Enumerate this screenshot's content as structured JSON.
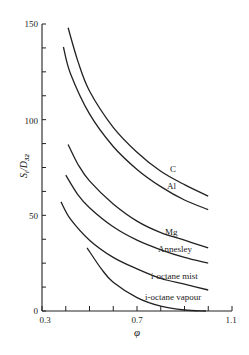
{
  "chart_data": {
    "type": "line",
    "title": "",
    "xlabel": "φ",
    "ylabel": "S_t/D_32",
    "xlim": [
      0.3,
      1.1
    ],
    "ylim": [
      0,
      150
    ],
    "x_ticks": [
      0.3,
      0.4,
      0.5,
      0.6,
      0.7,
      0.8,
      0.9,
      1.0,
      1.1
    ],
    "x_tick_labels": [
      "0.3",
      "",
      "",
      "",
      "0.7",
      "",
      "",
      "",
      "1.1"
    ],
    "y_ticks": [
      0,
      12.5,
      25,
      37.5,
      50,
      62.5,
      75,
      87.5,
      100,
      112.5,
      125,
      137.5,
      150
    ],
    "y_tick_labels": [
      "0",
      "50",
      "100",
      "150"
    ],
    "grid": false,
    "legend": "inline labels at curve ends",
    "series": [
      {
        "name": "C",
        "x": [
          0.41,
          0.45,
          0.5,
          0.6,
          0.7,
          0.8,
          0.9,
          1.0
        ],
        "y": [
          148,
          131,
          115,
          96,
          83,
          73,
          66,
          60
        ]
      },
      {
        "name": "Al",
        "x": [
          0.39,
          0.42,
          0.5,
          0.6,
          0.7,
          0.8,
          0.9,
          1.0
        ],
        "y": [
          138,
          124,
          103,
          86,
          74,
          65,
          58,
          53
        ]
      },
      {
        "name": "Mg",
        "x": [
          0.41,
          0.45,
          0.5,
          0.6,
          0.7,
          0.8,
          0.9,
          1.0
        ],
        "y": [
          87,
          77,
          68,
          56,
          47,
          41,
          37,
          33
        ]
      },
      {
        "name": "Annesley",
        "x": [
          0.4,
          0.45,
          0.5,
          0.6,
          0.7,
          0.8,
          0.9,
          1.0
        ],
        "y": [
          71,
          61,
          54,
          44,
          37,
          32,
          28,
          25
        ]
      },
      {
        "name": "i-octane mist",
        "x": [
          0.38,
          0.42,
          0.5,
          0.6,
          0.7,
          0.8,
          0.9,
          1.0
        ],
        "y": [
          57,
          48,
          37,
          28,
          22,
          17,
          14,
          11
        ]
      },
      {
        "name": "i-octane vapour",
        "x": [
          0.49,
          0.55,
          0.6,
          0.7,
          0.8,
          0.9,
          0.99
        ],
        "y": [
          33,
          22,
          15,
          7,
          2.5,
          0.5,
          0
        ]
      }
    ]
  },
  "labels": {
    "y_axis_title": "S",
    "y_axis_sub_t": "t",
    "y_axis_den": "/D",
    "y_axis_sub_32": "32",
    "x_axis_title": "φ",
    "y_tick_0": "0",
    "y_tick_50": "50",
    "y_tick_100": "100",
    "y_tick_150": "150",
    "x_tick_03": "0.3",
    "x_tick_07": "0.7",
    "x_tick_11": "1.1",
    "curve_C": "C",
    "curve_Al": "Al",
    "curve_Mg": "Mg",
    "curve_Annesley": "Annesley",
    "curve_mist": "i-octane mist",
    "curve_vapour": "i-octane vapour"
  }
}
